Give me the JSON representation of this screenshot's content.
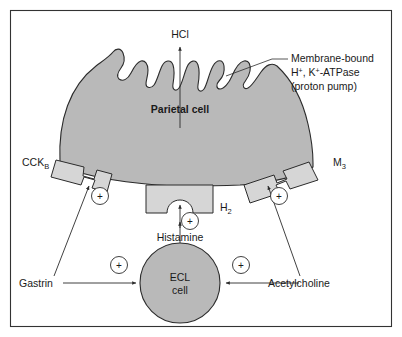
{
  "figure": {
    "background_color": "#ffffff",
    "frame_color": "#333333",
    "cell_fill_color": "#b9b9b9",
    "receptor_fill_color": "#d6d6d6",
    "line_color": "#2b2b2b"
  },
  "labels": {
    "hcl": "HCl",
    "parietal_cell": "Parietal cell",
    "membrane_pump_line1": "Membrane-bound",
    "membrane_pump_line2_a": "H",
    "membrane_pump_line2_sup1": "+",
    "membrane_pump_line2_b": ", K",
    "membrane_pump_line2_sup2": "+",
    "membrane_pump_line2_c": "-ATPase",
    "membrane_pump_line3": "(proton pump)",
    "cck_b_base": "CCK",
    "cck_b_sub": "B",
    "m3_base": "M",
    "m3_sub": "3",
    "h2_base": "H",
    "h2_sub": "2",
    "histamine": "Histamine",
    "ecl_line1": "ECL",
    "ecl_line2": "cell",
    "gastrin": "Gastrin",
    "acetylcholine": "Acetylcholine",
    "plus_sign": "+"
  },
  "receptors": [
    {
      "id": "cck-b",
      "label": "CCK",
      "subscript": "B",
      "ligand": "Gastrin",
      "effect": "+"
    },
    {
      "id": "h2",
      "label": "H",
      "subscript": "2",
      "ligand": "Histamine",
      "effect": "+"
    },
    {
      "id": "m3",
      "label": "M",
      "subscript": "3",
      "ligand": "Acetylcholine",
      "effect": "+"
    }
  ],
  "pathways": [
    {
      "from": "Gastrin",
      "to": "CCK_B receptor",
      "sign": "+"
    },
    {
      "from": "Gastrin",
      "to": "ECL cell",
      "sign": "+"
    },
    {
      "from": "Acetylcholine",
      "to": "M3 receptor",
      "sign": "+"
    },
    {
      "from": "Acetylcholine",
      "to": "ECL cell",
      "sign": "+"
    },
    {
      "from": "ECL cell",
      "to": "Histamine",
      "sign": "+"
    },
    {
      "from": "Histamine",
      "to": "H2 receptor",
      "sign": "+"
    },
    {
      "from": "Parietal cell",
      "to": "HCl",
      "sign": "secretion"
    }
  ]
}
